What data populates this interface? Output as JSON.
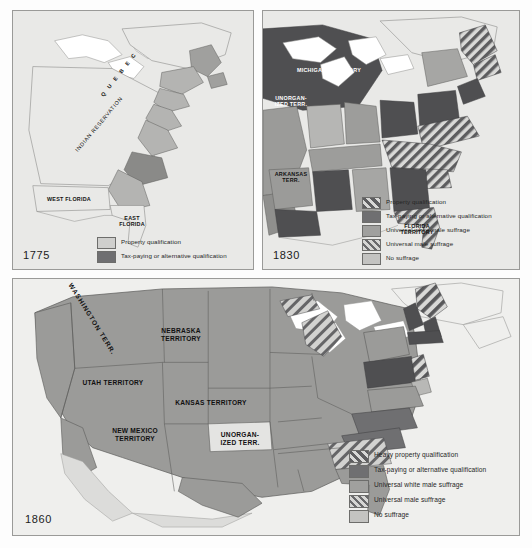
{
  "figure": {
    "type": "historical-map-series"
  },
  "panels": [
    {
      "id": "1775",
      "year_label": "1775",
      "map_labels": [
        {
          "name": "quebec",
          "text": "Q U E B E C"
        },
        {
          "name": "indian-reservation",
          "text": "INDIAN RESERVATION"
        },
        {
          "name": "west-florida",
          "text": "WEST FLORIDA"
        },
        {
          "name": "east-florida",
          "text": "EAST\nFLORIDA"
        }
      ],
      "legend": [
        {
          "swatch": "sw-light",
          "label": "Property qualification"
        },
        {
          "swatch": "sw-dark",
          "label": "Tax-paying or alternative qualification"
        }
      ]
    },
    {
      "id": "1830",
      "year_label": "1830",
      "map_labels": [
        {
          "name": "michigan-territory",
          "text": "MICHIGAN TERRITORY"
        },
        {
          "name": "unorganized-territory",
          "text": "UNORGAN-\nIZED TERR."
        },
        {
          "name": "arkansas-territory",
          "text": "ARKANSAS\nTERR."
        },
        {
          "name": "florida-territory",
          "text": "FLORIDA\nTERRITORY"
        }
      ],
      "legend": [
        {
          "swatch": "sw-darkstripe",
          "label": "Property qualification"
        },
        {
          "swatch": "sw-dark",
          "label": "Tax-paying or alternative qualification"
        },
        {
          "swatch": "sw-medium",
          "label": "Universal white male suffrage"
        },
        {
          "swatch": "sw-lightstripe",
          "label": "Universal male suffrage"
        },
        {
          "swatch": "sw-mediumlight",
          "label": "No suffrage"
        }
      ]
    },
    {
      "id": "1860",
      "year_label": "1860",
      "map_labels": [
        {
          "name": "washington-territory",
          "text": "WASHINGTON TERR."
        },
        {
          "name": "nebraska-territory",
          "text": "NEBRASKA\nTERRITORY"
        },
        {
          "name": "utah-territory",
          "text": "UTAH TERRITORY"
        },
        {
          "name": "kansas-territory",
          "text": "KANSAS TERRITORY"
        },
        {
          "name": "new-mexico-territory",
          "text": "NEW MEXICO\nTERRITORY"
        },
        {
          "name": "unorganized-territory",
          "text": "UNORGAN-\nIZED TERR."
        }
      ],
      "legend": [
        {
          "swatch": "sw-darkstripe",
          "label": "Heavy property qualification"
        },
        {
          "swatch": "sw-dark",
          "label": "Tax-paying or alternative qualification"
        },
        {
          "swatch": "sw-medium",
          "label": "Universal white male suffrage"
        },
        {
          "swatch": "sw-lightstripe",
          "label": "Universal male suffrage"
        },
        {
          "swatch": "sw-mediumlight",
          "label": "No suffrage"
        }
      ]
    }
  ],
  "colors": {
    "background": "#e9e9e7",
    "land_light": "#cfcfcd",
    "land_medium": "#a0a09e",
    "land_dark": "#6f6f71",
    "water": "#ffffff",
    "border": "#9a9a98"
  }
}
